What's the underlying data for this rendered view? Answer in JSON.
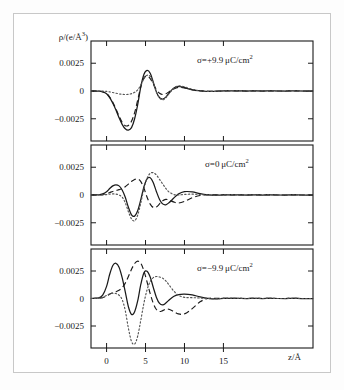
{
  "figure": {
    "title": "",
    "background_color": "#ffffff",
    "border_color": "#c8c8c8",
    "ink_color": "#1a1a1a"
  },
  "axes": {
    "y_axis_title_html": "&rho;/(e/&Aring;<sup>3</sup>)",
    "y_axis_title_text": "rho/(e/Angstrom^3)",
    "x_axis_title_html": "z/&Aring;",
    "x_axis_title_text": "z/Angstrom",
    "x_ticks": [
      "0",
      "5",
      "10",
      "15"
    ],
    "x_tick_values": [
      0,
      5,
      10,
      15
    ],
    "y_ticks": [
      "0.0025",
      "0",
      "−0.0025"
    ],
    "y_tick_values": [
      0.0025,
      0,
      -0.0025
    ],
    "x_range": [
      -2.0,
      26.5
    ],
    "y_range": [
      -0.0045,
      0.0045
    ],
    "x_minor_ticks": [
      -2,
      2.5,
      7.5,
      12.5,
      17.5,
      20,
      22.5,
      25
    ],
    "grid": "off",
    "legend": "none"
  },
  "panels": [
    {
      "id": "panel-top",
      "label_html": "&sigma;=+9.9&thinsp;&mu;C/cm<sup>2</sup>",
      "label_text": "sigma = +9.9 microC/cm^2",
      "sigma_value": 9.9,
      "sigma_units": "µC/cm²"
    },
    {
      "id": "panel-middle",
      "label_html": "&sigma;=0&thinsp;&mu;C/cm<sup>2</sup>",
      "label_text": "sigma = 0 microC/cm^2",
      "sigma_value": 0,
      "sigma_units": "µC/cm²"
    },
    {
      "id": "panel-bottom",
      "label_html": "&sigma;=&minus;9.9&thinsp;&mu;C/cm<sup>2</sup>",
      "label_text": "sigma = -9.9 microC/cm^2",
      "sigma_value": -9.9,
      "sigma_units": "µC/cm²"
    }
  ],
  "chart_data": {
    "type": "line",
    "title": "",
    "xlabel": "z/Å",
    "ylabel": "ρ/(e/Å³)",
    "xlim": [
      -2.0,
      26.5
    ],
    "ylim": [
      -0.0045,
      0.0045
    ],
    "x_ticks": [
      0,
      5,
      10,
      15
    ],
    "y_ticks": [
      0.0025,
      0,
      -0.0025
    ],
    "grid": false,
    "legend_position": "none",
    "subplots": [
      {
        "name": "σ=+9.9µC/cm²",
        "annotation": "σ=+9.9µC/cm²",
        "x": [
          -2.0,
          -1.0,
          -0.5,
          0.0,
          0.4,
          0.8,
          1.2,
          1.6,
          2.0,
          2.4,
          2.8,
          3.2,
          3.6,
          4.0,
          4.4,
          4.8,
          5.2,
          5.6,
          6.0,
          6.4,
          6.8,
          7.2,
          7.6,
          8.0,
          8.6,
          9.2,
          10.0,
          11.0,
          12.0,
          13.0,
          14.0,
          15.0,
          16.0,
          17.0,
          18.0,
          19.0,
          20.0,
          21.0,
          22.0,
          23.0,
          24.0,
          25.0,
          26.5
        ],
        "series": [
          {
            "name": "solid",
            "style": "solid",
            "values": [
              0.0,
              -2e-05,
              -8e-05,
              -0.00025,
              -0.0006,
              -0.0011,
              -0.0017,
              -0.0024,
              -0.003,
              -0.0034,
              -0.00352,
              -0.0033,
              -0.0025,
              -0.0012,
              0.0004,
              0.0015,
              0.00185,
              0.0016,
              0.0008,
              -0.0001,
              -0.0006,
              -0.00072,
              -0.00055,
              -0.0002,
              0.00025,
              0.00042,
              0.0003,
              0.0001,
              2e-05,
              -3e-05,
              -2e-05,
              1e-05,
              2e-05,
              1e-05,
              0.0,
              1e-05,
              0.0,
              1e-05,
              0.0,
              0.0,
              1e-05,
              0.0,
              0.0
            ]
          },
          {
            "name": "dashed",
            "style": "dashed",
            "values": [
              0.0,
              -2e-05,
              -7e-05,
              -0.00022,
              -0.00055,
              -0.00102,
              -0.0016,
              -0.00225,
              -0.00282,
              -0.00312,
              -0.0031,
              -0.00272,
              -0.00195,
              -0.0008,
              0.0004,
              0.00118,
              0.00135,
              0.00112,
              0.00062,
              0.0001,
              -0.0002,
              -0.00032,
              -0.00025,
              -8e-05,
              0.00018,
              0.00032,
              0.00028,
              0.00012,
              3e-05,
              -2e-05,
              -2e-05,
              1e-05,
              2e-05,
              1e-05,
              0.0,
              1e-05,
              0.0,
              1e-05,
              0.0,
              0.0,
              1e-05,
              0.0,
              0.0
            ]
          },
          {
            "name": "dotted",
            "style": "dotted",
            "values": [
              0.0,
              0.0,
              -1e-05,
              -3e-05,
              -8e-05,
              -0.00014,
              -0.0002,
              -0.00026,
              -0.0003,
              -0.00032,
              -0.0003,
              -0.00024,
              -0.00012,
              0.0001,
              0.00055,
              0.0011,
              0.00142,
              0.00132,
              0.0007,
              -0.0001,
              -0.00062,
              -0.0008,
              -0.00062,
              -0.00025,
              0.0002,
              0.00045,
              0.00038,
              0.00014,
              2e-05,
              -4e-05,
              -3e-05,
              1e-05,
              3e-05,
              1e-05,
              0.0,
              2e-05,
              0.0,
              2e-05,
              0.0,
              0.0,
              2e-05,
              0.0,
              0.0
            ]
          }
        ]
      },
      {
        "name": "σ=0µC/cm²",
        "annotation": "σ=0µC/cm²",
        "x": [
          -2.0,
          -1.0,
          -0.5,
          0.0,
          0.4,
          0.8,
          1.2,
          1.6,
          2.0,
          2.4,
          2.8,
          3.2,
          3.6,
          4.0,
          4.4,
          4.8,
          5.2,
          5.6,
          6.0,
          6.4,
          6.8,
          7.2,
          7.6,
          8.0,
          8.6,
          9.2,
          10.0,
          11.0,
          12.0,
          13.0,
          14.0,
          15.0,
          16.0,
          17.0,
          18.0,
          19.0,
          20.0,
          21.0,
          22.0,
          23.0,
          24.0,
          25.0,
          26.5
        ],
        "series": [
          {
            "name": "solid",
            "style": "solid",
            "values": [
              0.0,
              2e-05,
              0.0001,
              0.0003,
              0.00058,
              0.00082,
              0.00092,
              0.00082,
              0.00045,
              -0.0002,
              -0.0011,
              -0.00178,
              -0.0019,
              -0.0014,
              -0.0004,
              0.00075,
              0.00145,
              0.00155,
              0.0011,
              0.0003,
              -0.0004,
              -0.0008,
              -0.00088,
              -0.0007,
              -0.0003,
              8e-05,
              0.0003,
              0.00028,
              0.00012,
              2e-05,
              -2e-05,
              1e-05,
              2e-05,
              1e-05,
              0.0,
              1e-05,
              0.0,
              1e-05,
              0.0,
              0.0,
              1e-05,
              0.0,
              0.0
            ]
          },
          {
            "name": "dashed",
            "style": "dashed",
            "values": [
              0.0,
              1e-05,
              4e-05,
              0.00012,
              0.00022,
              0.00032,
              0.0004,
              0.00048,
              0.00058,
              0.00075,
              0.00098,
              0.00122,
              0.0014,
              0.00145,
              0.0012,
              0.0006,
              -0.0002,
              -0.00082,
              -0.00112,
              -0.00108,
              -0.0008,
              -0.00052,
              -0.0004,
              -0.00045,
              -0.00062,
              -0.00072,
              -0.00058,
              -0.00025,
              -5e-05,
              2e-05,
              1e-05,
              2e-05,
              1e-05,
              1e-05,
              0.0,
              1e-05,
              0.0,
              1e-05,
              0.0,
              0.0,
              1e-05,
              0.0,
              0.0
            ]
          },
          {
            "name": "dotted",
            "style": "dotted",
            "values": [
              0.0,
              0.0,
              1e-05,
              4e-05,
              8e-05,
              0.0001,
              8e-05,
              0.0,
              -0.0002,
              -0.0007,
              -0.0015,
              -0.00215,
              -0.00232,
              -0.0018,
              -0.0007,
              0.0006,
              0.0015,
              0.00195,
              0.002,
              0.0018,
              0.0014,
              0.001,
              0.0006,
              0.00028,
              5e-05,
              0.0,
              5e-05,
              8e-05,
              4e-05,
              0.0,
              -2e-05,
              1e-05,
              3e-05,
              1e-05,
              0.0,
              2e-05,
              0.0,
              2e-05,
              0.0,
              0.0,
              2e-05,
              0.0,
              0.0
            ]
          }
        ]
      },
      {
        "name": "σ=−9.9µC/cm²",
        "annotation": "σ=−9.9µC/cm²",
        "x": [
          -2.0,
          -1.0,
          -0.5,
          0.0,
          0.4,
          0.8,
          1.2,
          1.6,
          2.0,
          2.4,
          2.8,
          3.2,
          3.6,
          4.0,
          4.4,
          4.8,
          5.2,
          5.6,
          6.0,
          6.4,
          6.8,
          7.2,
          7.6,
          8.0,
          8.6,
          9.2,
          10.0,
          11.0,
          12.0,
          13.0,
          14.0,
          15.0,
          16.0,
          17.0,
          18.0,
          19.0,
          20.0,
          21.0,
          22.0,
          23.0,
          24.0,
          25.0,
          26.5
        ],
        "series": [
          {
            "name": "solid",
            "style": "solid",
            "values": [
              0.0,
              5e-05,
              0.0003,
              0.0011,
              0.0022,
              0.003,
              0.0032,
              0.00285,
              0.0019,
              0.0006,
              -0.00075,
              -0.00145,
              -0.0012,
              -0.0002,
              0.0013,
              0.00235,
              0.00248,
              0.00195,
              0.001,
              0.0001,
              -0.00045,
              -0.00058,
              -0.00042,
              -0.00015,
              0.00018,
              0.00035,
              0.0004,
              0.00032,
              0.00015,
              2e-05,
              -3e-05,
              1e-05,
              2e-05,
              1e-05,
              0.0,
              1e-05,
              0.0,
              1e-05,
              0.0,
              0.0,
              1e-05,
              0.0,
              0.0
            ]
          },
          {
            "name": "dashed",
            "style": "dashed",
            "values": [
              0.0,
              2e-05,
              8e-05,
              0.00022,
              0.00038,
              0.00052,
              0.00062,
              0.00075,
              0.00098,
              0.0014,
              0.002,
              0.00265,
              0.00318,
              0.0034,
              0.0032,
              0.0025,
              0.0015,
              0.00045,
              -0.00045,
              -0.001,
              -0.00118,
              -0.0011,
              -0.00098,
              -0.00098,
              -0.00118,
              -0.0014,
              -0.0014,
              -0.00092,
              -0.0003,
              0.0,
              2e-05,
              2e-05,
              1e-05,
              1e-05,
              0.0,
              1e-05,
              0.0,
              1e-05,
              0.0,
              0.0,
              1e-05,
              0.0,
              0.0
            ]
          },
          {
            "name": "dotted",
            "style": "dotted",
            "values": [
              0.0,
              2e-05,
              0.0001,
              0.00028,
              0.00042,
              0.00048,
              0.00045,
              0.0003,
              -0.0001,
              -0.0011,
              -0.0027,
              -0.0039,
              -0.00415,
              -0.0034,
              -0.00195,
              -0.0004,
              0.0008,
              0.00155,
              0.0019,
              0.002,
              0.00195,
              0.00185,
              0.0016,
              0.00125,
              0.0007,
              0.0003,
              0.0001,
              8e-05,
              4e-05,
              0.0,
              -2e-05,
              1e-05,
              3e-05,
              1e-05,
              0.0,
              2e-05,
              0.0,
              2e-05,
              0.0,
              0.0,
              2e-05,
              0.0,
              0.0
            ]
          }
        ]
      }
    ]
  }
}
